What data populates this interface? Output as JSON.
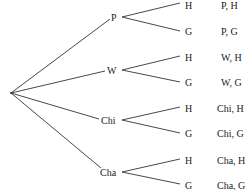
{
  "diagram": {
    "type": "tree",
    "root": {
      "x": 11,
      "y": 93
    },
    "level1": [
      {
        "label": "P",
        "x": 118,
        "y": 17,
        "label_x": 112
      },
      {
        "label": "W",
        "x": 118,
        "y": 70,
        "label_x": 109
      },
      {
        "label": "Chi",
        "x": 118,
        "y": 120,
        "label_x": 102
      },
      {
        "label": "Cha",
        "x": 118,
        "y": 172,
        "label_x": 101
      }
    ],
    "level2": [
      {
        "label": "H",
        "parent": 0,
        "y": 5,
        "outcome": "P, H"
      },
      {
        "label": "G",
        "parent": 0,
        "y": 32,
        "outcome": "P, G"
      },
      {
        "label": "H",
        "parent": 1,
        "y": 58,
        "outcome": "W, H"
      },
      {
        "label": "G",
        "parent": 1,
        "y": 83,
        "outcome": "W, G"
      },
      {
        "label": "H",
        "parent": 2,
        "y": 109,
        "outcome": "Chi, H"
      },
      {
        "label": "G",
        "parent": 2,
        "y": 134,
        "outcome": "Chi, G"
      },
      {
        "label": "H",
        "parent": 3,
        "y": 161,
        "outcome": "Cha, H"
      },
      {
        "label": "G",
        "parent": 3,
        "y": 185,
        "outcome": "Cha, G"
      }
    ],
    "leaf_x": 183,
    "outcome_x": 222
  }
}
